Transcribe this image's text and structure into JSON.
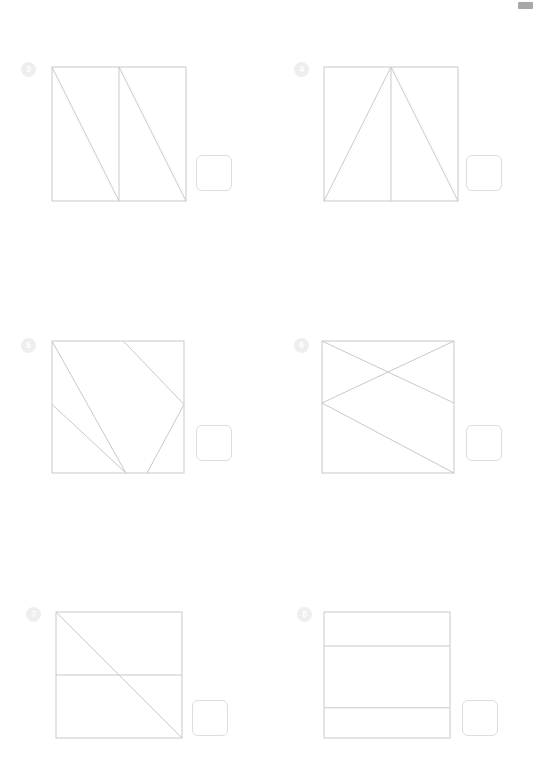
{
  "page": {
    "width": 536,
    "height": 771,
    "background_color": "#ffffff",
    "type": "worksheet",
    "corner_mark": {
      "name": "page-corner-mark",
      "x": 518,
      "y": 2,
      "width": 15,
      "height": 7,
      "color": "#a8a8a8"
    },
    "styles": {
      "line_color": "#c9c9c9",
      "badge_background": "#eeeeee",
      "badge_text_color": "#ffffff",
      "answer_box_border": "#dedede"
    }
  },
  "problems": [
    {
      "number": "3",
      "badge_x": 21,
      "badge_y": 62,
      "square": {
        "x": 52,
        "y": 67,
        "size": 134
      },
      "answer_box": {
        "x": 196,
        "y": 155
      },
      "lines": [
        {
          "name": "vertical-center-line",
          "x1": 0.5,
          "y1": 0,
          "x2": 0.5,
          "y2": 1
        },
        {
          "name": "diagonal-left-cell",
          "x1": 0,
          "y1": 0,
          "x2": 0.5,
          "y2": 1
        },
        {
          "name": "diagonal-right-cell",
          "x1": 0.5,
          "y1": 0,
          "x2": 1,
          "y2": 1
        }
      ]
    },
    {
      "number": "4",
      "badge_x": 294,
      "badge_y": 62,
      "square": {
        "x": 324,
        "y": 67,
        "size": 134
      },
      "answer_box": {
        "x": 466,
        "y": 155
      },
      "lines": [
        {
          "name": "triangle-left-side",
          "x1": 0,
          "y1": 1,
          "x2": 0.5,
          "y2": 0
        },
        {
          "name": "triangle-right-side",
          "x1": 0.5,
          "y1": 0,
          "x2": 1,
          "y2": 1
        },
        {
          "name": "vertical-center-line",
          "x1": 0.5,
          "y1": 0,
          "x2": 0.5,
          "y2": 1
        }
      ]
    },
    {
      "number": "5",
      "badge_x": 21,
      "badge_y": 338,
      "square": {
        "x": 52,
        "y": 341,
        "size": 132
      },
      "answer_box": {
        "x": 196,
        "y": 425
      },
      "lines": [
        {
          "name": "diagonal-topleft-to-bottomcenter",
          "x1": 0,
          "y1": 0,
          "x2": 0.56,
          "y2": 1
        },
        {
          "name": "diagonal-top-to-rightedge",
          "x1": 0.54,
          "y1": 0,
          "x2": 1,
          "y2": 0.48
        },
        {
          "name": "diagonal-leftedge-to-bottom",
          "x1": 0,
          "y1": 0.48,
          "x2": 0.56,
          "y2": 1
        },
        {
          "name": "diagonal-rightedge-to-bottom",
          "x1": 1,
          "y1": 0.48,
          "x2": 0.72,
          "y2": 1
        }
      ]
    },
    {
      "number": "6",
      "badge_x": 294,
      "badge_y": 338,
      "square": {
        "x": 322,
        "y": 341,
        "size": 132
      },
      "answer_box": {
        "x": 466,
        "y": 425
      },
      "lines": [
        {
          "name": "diagonal-topleft-to-rightedge",
          "x1": 0,
          "y1": 0,
          "x2": 1,
          "y2": 0.47
        },
        {
          "name": "diagonal-topright-to-leftedge",
          "x1": 1,
          "y1": 0,
          "x2": 0,
          "y2": 0.47
        },
        {
          "name": "diagonal-leftedge-to-bottomright",
          "x1": 0,
          "y1": 0.47,
          "x2": 1,
          "y2": 1
        }
      ]
    },
    {
      "number": "7",
      "badge_x": 26,
      "badge_y": 607,
      "square": {
        "x": 56,
        "y": 612,
        "size": 126
      },
      "answer_box": {
        "x": 192,
        "y": 700
      },
      "lines": [
        {
          "name": "diagonal-topleft-to-bottomright",
          "x1": 0,
          "y1": 0,
          "x2": 1,
          "y2": 1
        },
        {
          "name": "horizontal-center-line",
          "x1": 0,
          "y1": 0.5,
          "x2": 1,
          "y2": 0.5
        }
      ]
    },
    {
      "number": "8",
      "badge_x": 297,
      "badge_y": 607,
      "square": {
        "x": 324,
        "y": 612,
        "size": 126
      },
      "answer_box": {
        "x": 462,
        "y": 700
      },
      "lines": [
        {
          "name": "horizontal-upper-line",
          "x1": 0,
          "y1": 0.27,
          "x2": 1,
          "y2": 0.27
        },
        {
          "name": "horizontal-lower-line",
          "x1": 0,
          "y1": 0.76,
          "x2": 1,
          "y2": 0.76
        }
      ]
    }
  ]
}
